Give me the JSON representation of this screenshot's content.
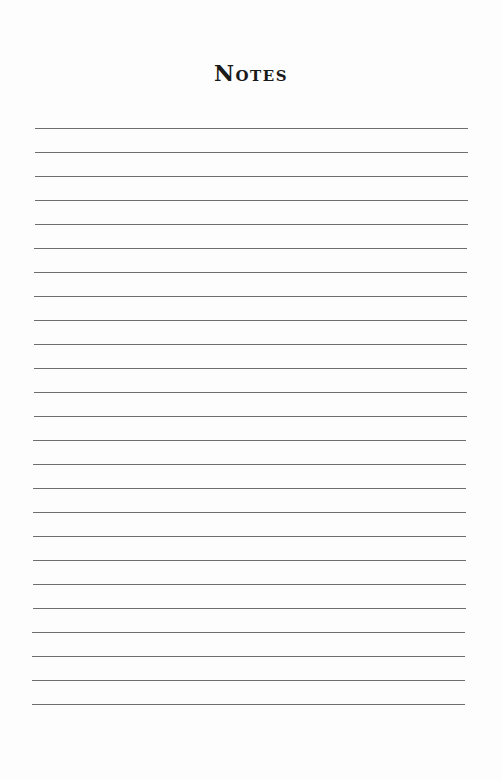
{
  "page": {
    "title": "Notes",
    "line_count": 25,
    "line_color": "#6e6e6e",
    "background_color": "#fdfdfd"
  }
}
